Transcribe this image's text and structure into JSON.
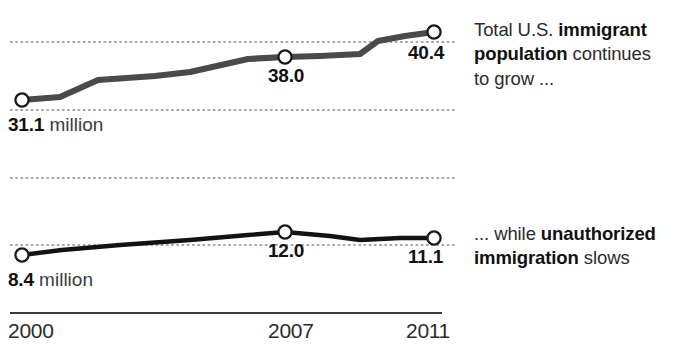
{
  "chart_data": {
    "type": "line",
    "title": "",
    "subtitle": "",
    "xlabel": "",
    "ylabel": "",
    "grid": true,
    "legend_position": "none",
    "x": [
      2000,
      2001,
      2002,
      2003,
      2004,
      2005,
      2006,
      2007,
      2008,
      2009,
      2010,
      2011
    ],
    "tick_labels": [
      "2000",
      "2007",
      "2011"
    ],
    "tick_values": [
      2000,
      2007,
      2011
    ],
    "units": "millions",
    "series": [
      {
        "name": "Total U.S. immigrant population",
        "panel": "top",
        "values": [
          31.1,
          31.8,
          33.8,
          34.3,
          35.7,
          37.0,
          37.5,
          38.0,
          38.9,
          38.5,
          39.9,
          40.4
        ],
        "labeled_points": [
          {
            "x": 2000,
            "value": "31.1",
            "unit": " million"
          },
          {
            "x": 2007,
            "value": "38.0",
            "unit": ""
          },
          {
            "x": 2011,
            "value": "40.4",
            "unit": ""
          }
        ],
        "ylim": [
          30.0,
          41.5
        ],
        "color": "#4a4a4a",
        "marker": "open-circle"
      },
      {
        "name": "Unauthorized immigrant population",
        "panel": "bottom",
        "values": [
          8.4,
          9.3,
          9.9,
          10.4,
          10.9,
          11.3,
          11.6,
          12.0,
          11.8,
          11.3,
          11.4,
          11.1
        ],
        "labeled_points": [
          {
            "x": 2000,
            "value": "8.4",
            "unit": " million"
          },
          {
            "x": 2007,
            "value": "12.0",
            "unit": ""
          },
          {
            "x": 2011,
            "value": "11.1",
            "unit": ""
          }
        ],
        "ylim": [
          8.0,
          12.6
        ],
        "color": "#121212",
        "marker": "open-circle"
      }
    ],
    "annotations": [
      {
        "id": "top-note",
        "text": "Total U.S. immigrant population continues to grow ...",
        "runs": [
          {
            "text": "Total U.S. ",
            "bold": false
          },
          {
            "text": "immigrant population",
            "bold": true
          },
          {
            "text": " continues to grow ...",
            "bold": false
          }
        ]
      },
      {
        "id": "bottom-note",
        "text": "... while unauthorized immigration slows",
        "runs": [
          {
            "text": "... while ",
            "bold": false
          },
          {
            "text": "unauthorized immigration",
            "bold": true
          },
          {
            "text": " slows",
            "bold": false
          }
        ]
      }
    ]
  },
  "labels": {
    "top_start": {
      "value": "31.1",
      "unit": " million"
    },
    "top_mid": {
      "value": "38.0",
      "unit": ""
    },
    "top_end": {
      "value": "40.4",
      "unit": ""
    },
    "bottom_start": {
      "value": "8.4",
      "unit": " million"
    },
    "bottom_mid": {
      "value": "12.0",
      "unit": ""
    },
    "bottom_end": {
      "value": "11.1",
      "unit": ""
    }
  },
  "axis": {
    "ticks": [
      "2000",
      "2007",
      "2011"
    ]
  },
  "colors": {
    "top_line": "#4a4a4a",
    "bottom_line": "#121212",
    "gridline": "#8c8c8c",
    "axis_line": "#3b3b3b",
    "marker_fill": "#ffffff",
    "text": "#2b2b2b",
    "text_emphasis": "#111111"
  }
}
